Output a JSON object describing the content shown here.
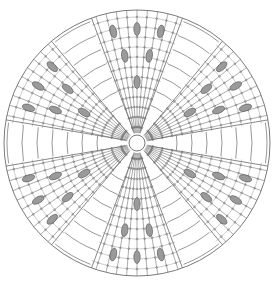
{
  "diagram": {
    "type": "crochet-round-chart",
    "center": [
      137,
      143
    ],
    "outer_radius": 133,
    "center_ring_radius": 8,
    "colors": {
      "background": "#ffffff",
      "line": "#6b6b6b",
      "bobble_fill": "#9a9a9a",
      "bobble_stroke": "#555555"
    },
    "panels": {
      "count": 6,
      "angles_deg": [
        0,
        60,
        120,
        180,
        240,
        300
      ],
      "half_width_deg_outer": 10,
      "rung_radii": [
        40,
        55,
        70,
        85,
        100,
        115,
        130
      ]
    },
    "wedges": {
      "count": 6,
      "center_angles_deg": [
        30,
        90,
        150,
        210,
        270,
        330
      ],
      "spokes_per_wedge": 9,
      "ring_radii": [
        16,
        26,
        36,
        46,
        56,
        66,
        76,
        86,
        96,
        106,
        116,
        126
      ],
      "bobbles": [
        {
          "r": 61,
          "offset_deg": 0
        },
        {
          "r": 88,
          "offset_deg": -8
        },
        {
          "r": 88,
          "offset_deg": 8
        },
        {
          "r": 114,
          "offset_deg": -12
        },
        {
          "r": 114,
          "offset_deg": 0
        },
        {
          "r": 114,
          "offset_deg": 12
        }
      ]
    }
  }
}
